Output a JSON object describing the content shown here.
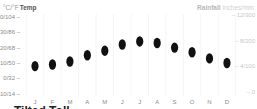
{
  "chart_data": {
    "type": "scatter",
    "title": "",
    "left_axis_title": {
      "units": "°C/°F",
      "label": "Temp"
    },
    "right_axis_title": {
      "label": "Rainfall",
      "units": "inches/mm"
    },
    "categories": [
      "J",
      "F",
      "M",
      "A",
      "M",
      "J",
      "J",
      "A",
      "S",
      "O",
      "N",
      "D"
    ],
    "series": [
      {
        "name": "Temp (°C)",
        "values": [
          8,
          9,
          11,
          15,
          18,
          22,
          24,
          23,
          20,
          17,
          13,
          10
        ]
      },
      {
        "name": "Rainfall",
        "values": [
          0,
          0,
          0,
          0,
          0,
          0,
          0,
          0,
          0,
          0,
          0,
          0
        ]
      }
    ],
    "left_ticks": [
      "40/104",
      "30/86",
      "20/68",
      "10/50",
      "0/32",
      "-10/14"
    ],
    "left_tick_values": [
      40,
      30,
      20,
      10,
      0,
      -10
    ],
    "right_ticks": [
      "12/300",
      "8/200",
      "4/100",
      "0"
    ],
    "right_tick_values": [
      12,
      8,
      4,
      0
    ],
    "ylim": [
      -10,
      40
    ],
    "y2lim": [
      0,
      12
    ],
    "grid": "vertical column dividers",
    "legend": "none (axis titles act as legend)"
  },
  "footer": {
    "cut_off_text": "Tilted Toll"
  }
}
